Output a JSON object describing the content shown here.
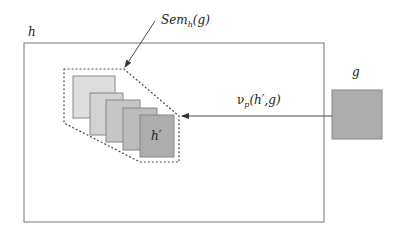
{
  "labels": {
    "outer": "h",
    "sem_main": "Sem",
    "sem_sub": "h",
    "sem_arg": "(g)",
    "group_element": "g",
    "h_prime": "h′",
    "nu_main": "ν",
    "nu_sub": "p",
    "nu_arg": "(h′,g)"
  },
  "colors": {
    "stroke": "#666666",
    "square_1": "#dedede",
    "square_2": "#d2d2d2",
    "square_3": "#c6c6c6",
    "square_4": "#bcbcbc",
    "square_5": "#adadad",
    "g_square": "#adadad"
  }
}
